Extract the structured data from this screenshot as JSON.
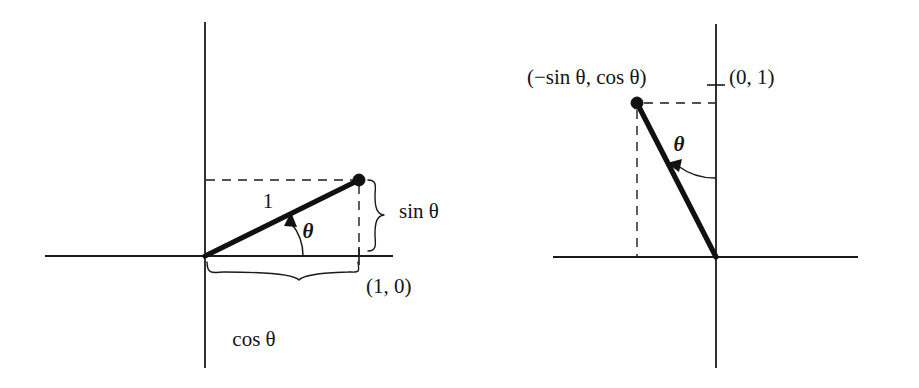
{
  "figure": {
    "title": "",
    "background_color": "#ffffff",
    "ink_color": "#141414",
    "panels": [
      {
        "id": "left",
        "name": "unit-vector-cos-sin",
        "description": "Unit vector at angle theta from positive x-axis, showing components cos theta and sin theta",
        "origin": [
          205,
          256
        ],
        "point": [
          359,
          180
        ],
        "vector_length_label": "1",
        "angle_label": "θ",
        "labels": {
          "radius": "1",
          "angle": "θ",
          "point_on_axis": "(1, 0)",
          "vertical_component": "sin θ",
          "horizontal_component": "cos θ"
        }
      },
      {
        "id": "right",
        "name": "rotated-vector-minus-sin-cos",
        "description": "Vector rotated 90 degrees, endpoint labelled (-sin theta, cos theta), with unit point (0, 1) on the y-axis",
        "origin": [
          716,
          257
        ],
        "point": [
          637,
          103
        ],
        "angle_label": "θ",
        "labels": {
          "point_coordinates": "(−sin θ, cos θ)",
          "axis_point": "(0, 1)",
          "angle": "θ"
        }
      }
    ],
    "text_items": [
      {
        "key": "left_radius",
        "text": "1",
        "x": 268,
        "y": 203
      },
      {
        "key": "left_theta",
        "text": "θ",
        "x": 308,
        "y": 233
      },
      {
        "key": "left_point",
        "text": "(1, 0)",
        "x": 366,
        "y": 287
      },
      {
        "key": "left_sin",
        "text": "sin θ",
        "x": 399,
        "y": 212
      },
      {
        "key": "left_cos",
        "text": "cos θ",
        "x": 254,
        "y": 340
      },
      {
        "key": "right_point",
        "text": "(−sin θ, cos θ)",
        "x": 527,
        "y": 78
      },
      {
        "key": "right_axispoint",
        "text": "(0, 1)",
        "x": 729,
        "y": 78
      },
      {
        "key": "right_theta",
        "text": "θ",
        "x": 679,
        "y": 146
      }
    ]
  }
}
